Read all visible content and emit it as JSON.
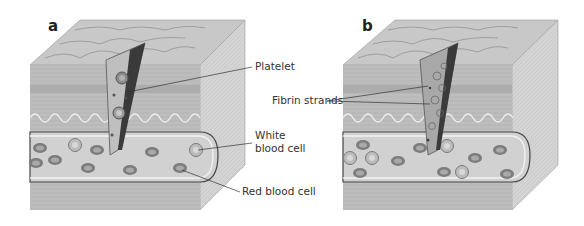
{
  "figure": {
    "panels": [
      {
        "letter": "a",
        "labels": {
          "platelet": "Platelet",
          "white_blood_cell_line1": "White",
          "white_blood_cell_line2": "blood cell",
          "red_blood_cell": "Red blood cell"
        }
      },
      {
        "letter": "b",
        "labels": {
          "fibrin_strands": "Fibrin strands"
        }
      }
    ],
    "colors": {
      "background": "#ffffff",
      "top_face": "#c9c9c9",
      "front_face": "#b8b8b8",
      "side_face": "#d6d6d6",
      "vessel_interior": "#d0d0d0",
      "cell": "#8a8a8a",
      "text": "#333333"
    }
  }
}
